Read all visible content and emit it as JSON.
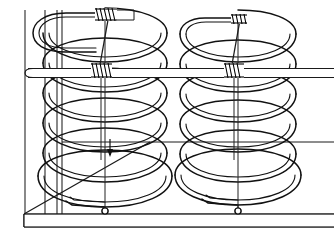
{
  "figure": {
    "background_color": "#ffffff",
    "line_color": "#111111",
    "width": 334,
    "height": 235
  },
  "scene": {
    "base_platform": {
      "name": "base-platform",
      "front_edge_y": 214,
      "bottom_edge_y": 227,
      "left_x": 24,
      "right_x": 334,
      "back_corner_x": 150,
      "back_corner_y": 142,
      "label": ""
    },
    "back_wall": {
      "name": "back-wall",
      "vertical_lines_x": [
        25,
        45,
        57,
        62
      ],
      "top_y": 8,
      "bottom_y": 214,
      "label": ""
    },
    "cross_rod": {
      "name": "horizontal-cross-rod",
      "top_y": 68,
      "bottom_y": 78,
      "left_x": 28,
      "right_x": 334,
      "label": ""
    },
    "shelf_line": {
      "name": "mid-shelf-edge",
      "y": 142,
      "left_x": 150,
      "right_x": 334,
      "label": ""
    }
  },
  "springs": [
    {
      "name": "left-spring",
      "center_x": 105,
      "rx": 62,
      "ry": 19,
      "top_y": 28,
      "bottom_y": 200,
      "turns": 6,
      "axis_line": {
        "top_y": 26,
        "bottom_y": 212
      },
      "end_marker": {
        "cx": 105,
        "cy": 212,
        "r": 3,
        "shape": "circle"
      },
      "clamps": [
        {
          "name": "top-clamp",
          "cx": 105,
          "cy": 16,
          "coils": 6
        },
        {
          "name": "mid-clamp",
          "cx": 101,
          "cy": 72,
          "coils": 6
        }
      ],
      "tie_wire": {
        "from_x": 107,
        "from_y": 20,
        "to_x": 100,
        "to_y": 70
      },
      "force_arrow": {
        "x": 109,
        "y_top": 141,
        "y_bottom": 157,
        "direction": "down"
      },
      "label": ""
    },
    {
      "name": "right-spring",
      "center_x": 238,
      "rx": 58,
      "ry": 18,
      "top_y": 28,
      "bottom_y": 198,
      "turns": 6,
      "axis_line": {
        "top_y": 22,
        "bottom_y": 212
      },
      "end_marker": {
        "cx": 238,
        "cy": 212,
        "r": 3,
        "shape": "circle"
      },
      "clamps": [
        {
          "name": "top-clamp",
          "cx": 238,
          "cy": 20,
          "coils": 5
        },
        {
          "name": "mid-clamp",
          "cx": 233,
          "cy": 72,
          "coils": 6
        }
      ],
      "tie_wire": {
        "from_x": 239,
        "from_y": 23,
        "to_x": 232,
        "to_y": 70
      },
      "force_arrow": null,
      "label": ""
    }
  ],
  "annotations": {
    "items": []
  }
}
